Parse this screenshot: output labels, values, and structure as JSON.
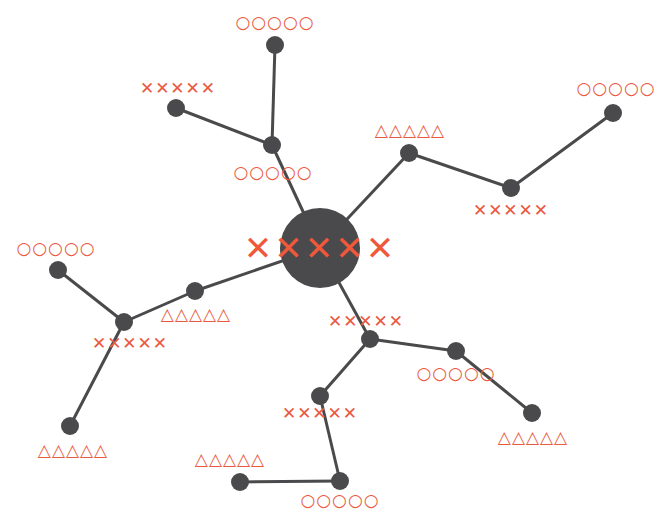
{
  "colors": {
    "node": "#4a4a4c",
    "edge": "#4a4a4c",
    "label": "#ea5a3f"
  },
  "center": {
    "x": 320,
    "y": 248,
    "r": 40,
    "label": "✕✕✕✕✕"
  },
  "nodes": [
    {
      "id": "n1",
      "x": 272,
      "y": 145,
      "label": "○○○○○",
      "lx": 273,
      "ly": 172
    },
    {
      "id": "n2",
      "x": 275,
      "y": 45,
      "label": "○○○○○",
      "lx": 275,
      "ly": 22
    },
    {
      "id": "n3",
      "x": 176,
      "y": 108,
      "label": "✕✕✕✕✕",
      "lx": 178,
      "ly": 88
    },
    {
      "id": "n4",
      "x": 409,
      "y": 153,
      "label": "△△△△△",
      "lx": 410,
      "ly": 130
    },
    {
      "id": "n5",
      "x": 511,
      "y": 188,
      "label": "✕✕✕✕✕",
      "lx": 511,
      "ly": 210
    },
    {
      "id": "n6",
      "x": 613,
      "y": 113,
      "label": "○○○○○",
      "lx": 616,
      "ly": 88
    },
    {
      "id": "n7",
      "x": 195,
      "y": 291,
      "label": "△△△△△",
      "lx": 196,
      "ly": 314
    },
    {
      "id": "n8",
      "x": 124,
      "y": 322,
      "label": "✕✕✕✕✕",
      "lx": 130,
      "ly": 343
    },
    {
      "id": "n9",
      "x": 58,
      "y": 270,
      "label": "○○○○○",
      "lx": 56,
      "ly": 248
    },
    {
      "id": "n10",
      "x": 70,
      "y": 426,
      "label": "△△△△△",
      "lx": 73,
      "ly": 450
    },
    {
      "id": "n11",
      "x": 370,
      "y": 339,
      "label": "✕✕✕✕✕",
      "lx": 366,
      "ly": 321
    },
    {
      "id": "n12",
      "x": 456,
      "y": 351,
      "label": "○○○○○",
      "lx": 456,
      "ly": 373
    },
    {
      "id": "n13",
      "x": 532,
      "y": 413,
      "label": "△△△△△",
      "lx": 533,
      "ly": 437
    },
    {
      "id": "n14",
      "x": 320,
      "y": 396,
      "label": "✕✕✕✕✕",
      "lx": 320,
      "ly": 413
    },
    {
      "id": "n15",
      "x": 340,
      "y": 481,
      "label": "○○○○○",
      "lx": 340,
      "ly": 500
    },
    {
      "id": "n16",
      "x": 240,
      "y": 482,
      "label": "△△△△△",
      "lx": 230,
      "ly": 459
    }
  ],
  "edges": [
    [
      "center",
      "n1"
    ],
    [
      "n1",
      "n2"
    ],
    [
      "n1",
      "n3"
    ],
    [
      "center",
      "n4"
    ],
    [
      "n4",
      "n5"
    ],
    [
      "n5",
      "n6"
    ],
    [
      "center",
      "n7"
    ],
    [
      "n7",
      "n8"
    ],
    [
      "n8",
      "n9"
    ],
    [
      "n8",
      "n10"
    ],
    [
      "center",
      "n11"
    ],
    [
      "n11",
      "n12"
    ],
    [
      "n12",
      "n13"
    ],
    [
      "n11",
      "n14"
    ],
    [
      "n14",
      "n15"
    ],
    [
      "n15",
      "n16"
    ]
  ]
}
